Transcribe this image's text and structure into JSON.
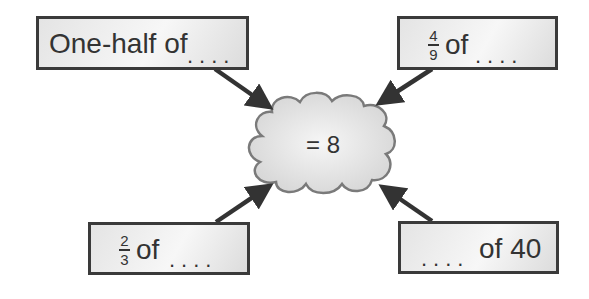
{
  "center": {
    "label": "= 8"
  },
  "boxes": [
    {
      "id": "top-left",
      "text": "One-half of",
      "blank": "...."
    },
    {
      "id": "top-right",
      "numerator": "4",
      "denominator": "9",
      "text": "of",
      "blank": "...."
    },
    {
      "id": "bottom-left",
      "numerator": "2",
      "denominator": "3",
      "text": "of",
      "blank": "...."
    },
    {
      "id": "bottom-right",
      "blank": "....",
      "text": "of 40"
    }
  ],
  "colors": {
    "border": "#3a3a3a",
    "arrow": "#333333",
    "cloud_stroke": "#7a7a7a",
    "cloud_fill": "#e2e2e2"
  }
}
